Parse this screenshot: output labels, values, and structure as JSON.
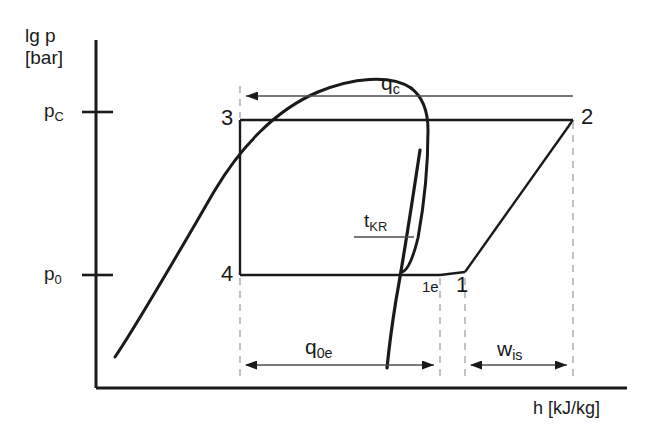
{
  "diagram": {
    "type": "log-p-h-diagram",
    "axes": {
      "y": {
        "label_line1": "lg p",
        "label_line2": "[bar]",
        "ticks": [
          {
            "id": "pC",
            "label_base": "p",
            "label_sub": "C",
            "y": 112
          },
          {
            "id": "p0",
            "label_base": "p",
            "label_sub": "0",
            "y": 275
          }
        ]
      },
      "x": {
        "label": "h [kJ/kg]"
      }
    },
    "points": [
      {
        "id": "1",
        "label": "1",
        "x": 465,
        "y": 272
      },
      {
        "id": "1e",
        "label": "1e",
        "x": 440,
        "y": 272
      },
      {
        "id": "2",
        "label": "2",
        "x": 573,
        "y": 120
      },
      {
        "id": "3",
        "label": "3",
        "x": 240,
        "y": 120
      },
      {
        "id": "4",
        "label": "4",
        "x": 240,
        "y": 275
      }
    ],
    "curve_labels": [
      {
        "id": "tKR",
        "base": "t",
        "sub": "KR",
        "note": "critical/isotherm line label with leader"
      }
    ],
    "energy_arrows": [
      {
        "id": "qc",
        "base": "q",
        "sub": "c",
        "direction": "left",
        "x_start": 240,
        "x_end": 573,
        "y": 96
      },
      {
        "id": "q0e",
        "base": "q",
        "sub": "0e",
        "direction": "both",
        "x_start": 240,
        "x_end": 440,
        "y": 365
      },
      {
        "id": "wis",
        "base": "w",
        "sub": "is",
        "direction": "both",
        "x_start": 465,
        "x_end": 573,
        "y": 365
      }
    ],
    "colors": {
      "line": "#1a1a1a",
      "thin_line": "#4d4d4d",
      "dashed": "#b3b3b3",
      "background": "#ffffff"
    }
  }
}
